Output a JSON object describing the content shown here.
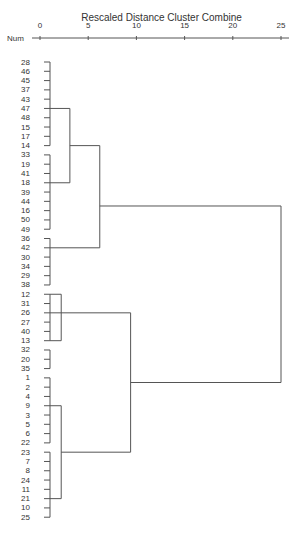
{
  "chart_data": {
    "type": "dendrogram",
    "title": "Rescaled Distance Cluster Combine",
    "row_header": "Num",
    "xlabel": "Rescaled Distance Cluster Combine",
    "xlim": [
      0,
      25
    ],
    "x_ticks": [
      0,
      5,
      10,
      15,
      20,
      25
    ],
    "leaf_order": [
      "28",
      "46",
      "45",
      "37",
      "43",
      "47",
      "48",
      "15",
      "17",
      "14",
      "33",
      "19",
      "41",
      "18",
      "39",
      "44",
      "16",
      "50",
      "49",
      "36",
      "42",
      "30",
      "34",
      "29",
      "38",
      "12",
      "31",
      "26",
      "27",
      "40",
      "13",
      "32",
      "20",
      "35",
      "1",
      "2",
      "4",
      "9",
      "3",
      "5",
      "6",
      "22",
      "23",
      "7",
      "8",
      "24",
      "11",
      "21",
      "10",
      "25"
    ],
    "merges": [
      {
        "cluster": "A",
        "members": [
          "28",
          "46",
          "45",
          "37",
          "43",
          "47",
          "48",
          "15",
          "17",
          "14"
        ],
        "height": 0.5
      },
      {
        "cluster": "B",
        "members": [
          "33",
          "19",
          "41",
          "18",
          "39",
          "44",
          "16",
          "50",
          "49"
        ],
        "height": 0.5
      },
      {
        "cluster": "A+B",
        "joins": [
          "A",
          "B"
        ],
        "height": 3.0
      },
      {
        "cluster": "C",
        "members": [
          "36",
          "42",
          "30",
          "34",
          "29",
          "38"
        ],
        "height": 0.5
      },
      {
        "cluster": "AB+C",
        "joins": [
          "A+B",
          "C"
        ],
        "height": 6.2
      },
      {
        "cluster": "D",
        "members": [
          "12",
          "31",
          "26",
          "27",
          "40",
          "13"
        ],
        "height": 2.2
      },
      {
        "cluster": "E",
        "members": [
          "32",
          "20",
          "35"
        ],
        "height": 0.5
      },
      {
        "cluster": "F",
        "members": [
          "1",
          "2",
          "4",
          "9",
          "3",
          "5",
          "6",
          "22"
        ],
        "height": 0.5
      },
      {
        "cluster": "G",
        "members": [
          "23",
          "7",
          "8",
          "24",
          "11",
          "21",
          "10",
          "25"
        ],
        "height": 0.5
      },
      {
        "cluster": "F+G",
        "joins": [
          "F",
          "G"
        ],
        "height": 2.2
      },
      {
        "cluster": "DE+FG",
        "joins": [
          "D",
          "F+G"
        ],
        "height": 9.4
      },
      {
        "cluster": "ALL",
        "joins": [
          "AB+C",
          "DE+FG"
        ],
        "height": 25
      }
    ]
  }
}
